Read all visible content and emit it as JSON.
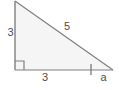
{
  "figure": {
    "name": "right-triangle-with-labeled-sides",
    "background_color": "#ffffff",
    "fill_color": "#f5f5f5",
    "stroke_color": "#808080",
    "text_color": "#4d4d4d",
    "width": 119,
    "height": 90
  },
  "geometry": {
    "apex_top": {
      "x": 15,
      "y": 1
    },
    "right_angle_vertex": {
      "x": 15,
      "y": 70
    },
    "vertex_right": {
      "x": 113,
      "y": 70
    },
    "right_angle_marker": {
      "x": 15,
      "y": 61,
      "size": 9
    },
    "tick_mark": {
      "x": 91,
      "y_top": 64,
      "y_bottom": 75
    }
  },
  "labels": {
    "leg_vertical": "3",
    "hypotenuse": "5",
    "leg_horizontal": "3",
    "segment_a": "a"
  },
  "icons": {
    "right_angle_marker": "right-angle-icon",
    "tick_mark": "tick-mark-icon"
  }
}
